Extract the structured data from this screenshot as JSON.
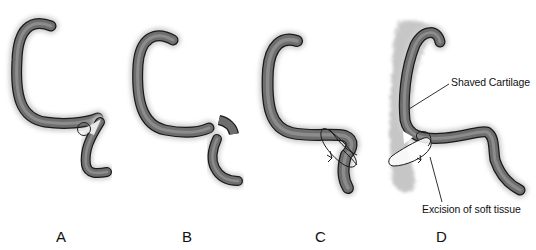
{
  "figure": {
    "panels": [
      {
        "id": "A",
        "label": "A"
      },
      {
        "id": "B",
        "label": "B"
      },
      {
        "id": "C",
        "label": "C"
      },
      {
        "id": "D",
        "label": "D"
      }
    ],
    "annotations": {
      "shaved_cartilage": "Shaved Cartilage",
      "excision_soft_tissue": "Excision of soft tissue"
    },
    "colors": {
      "cartilage_fill": "#6e6e6e",
      "cartilage_outline": "#1a1a1a",
      "soft_tissue": "#c9c9c9",
      "background": "#ffffff"
    }
  }
}
